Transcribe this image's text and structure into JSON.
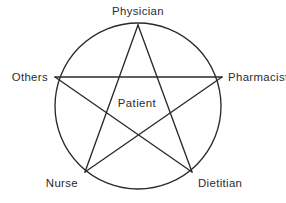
{
  "figure": {
    "center_label": "Patient",
    "background_color": "#ffffff",
    "line_color": "#2a2a2a",
    "text_color": "#2b2b2b"
  },
  "chart_data": {
    "type": "diagram",
    "shape": "pentagram-in-circle",
    "title": "",
    "center_node": "Patient",
    "nodes": [
      {
        "label": "Physician",
        "position": "top",
        "angle_deg": -90,
        "x": 138,
        "y": 25,
        "label_x": 138,
        "label_y": 15,
        "anchor": "middle"
      },
      {
        "label": "Pharmacist",
        "position": "right",
        "angle_deg": -18,
        "x": 222,
        "y": 77,
        "label_x": 228,
        "label_y": 81,
        "anchor": "start"
      },
      {
        "label": "Dietitian",
        "position": "bottom-right",
        "angle_deg": 54,
        "x": 192,
        "y": 172,
        "label_x": 198,
        "label_y": 187,
        "anchor": "start"
      },
      {
        "label": "Nurse",
        "position": "bottom-left",
        "angle_deg": 126,
        "x": 85,
        "y": 172,
        "label_x": 78,
        "label_y": 187,
        "anchor": "end"
      },
      {
        "label": "Others",
        "position": "left",
        "angle_deg": 198,
        "x": 55,
        "y": 77,
        "label_x": 48,
        "label_y": 81,
        "anchor": "end"
      }
    ],
    "edges": [
      {
        "from": "Physician",
        "to": "Dietitian"
      },
      {
        "from": "Dietitian",
        "to": "Others"
      },
      {
        "from": "Others",
        "to": "Pharmacist"
      },
      {
        "from": "Pharmacist",
        "to": "Nurse"
      },
      {
        "from": "Nurse",
        "to": "Physician"
      }
    ],
    "circle": {
      "cx": 138,
      "cy": 106,
      "r": 83
    },
    "grid": false,
    "legend": "none"
  }
}
